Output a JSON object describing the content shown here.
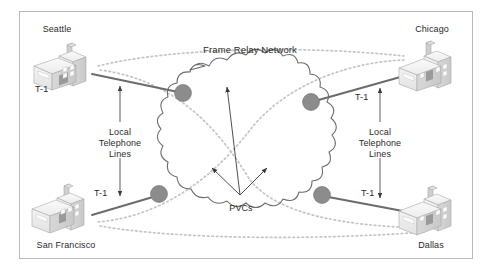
{
  "figure": {
    "network_label": "Frame Relay Network",
    "pvc_label": "PVCs",
    "border_color": "#b9b9b9",
    "background_color": "#ffffff",
    "node_color": "#8c8c8c",
    "trunk_line_color": "#6b6b6b",
    "pvc_line_color": "#c4c4c4",
    "text_color": "#2b2b2b"
  },
  "sites": [
    {
      "id": "seattle",
      "name": "Seattle",
      "position": "top-left",
      "link_label": "T-1",
      "local_loop_label": "Local\nTelephone\nLines"
    },
    {
      "id": "chicago",
      "name": "Chicago",
      "position": "top-right",
      "link_label": "T-1",
      "local_loop_label": "Local\nTelephone\nLines"
    },
    {
      "id": "san-francisco",
      "name": "San Francisco",
      "position": "bottom-left",
      "link_label": "T-1",
      "local_loop_label": "Local\nTelephone\nLines"
    },
    {
      "id": "dallas",
      "name": "Dallas",
      "position": "bottom-right",
      "link_label": "T-1",
      "local_loop_label": "Local\nTelephone\nLines"
    }
  ],
  "labels": {
    "seattle": "Seattle",
    "chicago": "Chicago",
    "san_francisco": "San Francisco",
    "dallas": "Dallas",
    "network": "Frame Relay Network",
    "pvcs": "PVCs",
    "t1_seattle": "T-1",
    "t1_chicago": "T-1",
    "t1_sanfrancisco": "T-1",
    "t1_dallas": "T-1",
    "local_left_line1": "Local",
    "local_left_line2": "Telephone",
    "local_left_line3": "Lines",
    "local_right_line1": "Local",
    "local_right_line2": "Telephone",
    "local_right_line3": "Lines"
  }
}
